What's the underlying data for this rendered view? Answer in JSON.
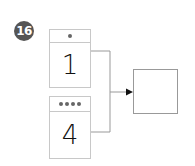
{
  "problem": {
    "number": "16",
    "badge_color": "#555555"
  },
  "cards": [
    {
      "dots": 1,
      "value": "1"
    },
    {
      "dots": 4,
      "value": "4"
    }
  ],
  "answer_box": {
    "value": ""
  },
  "colors": {
    "card_border": "#c8c8c8",
    "line": "#999999",
    "dot": "#666666"
  }
}
